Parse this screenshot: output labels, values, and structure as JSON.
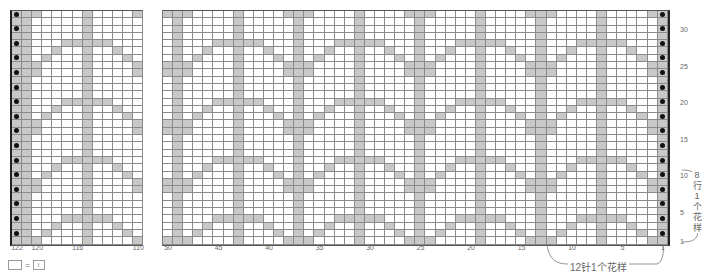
{
  "chart": {
    "rows": 32,
    "left_block": {
      "col_start": 122,
      "col_end": 110
    },
    "main_block": {
      "col_start": 50,
      "col_end": 1
    },
    "repeat": {
      "stitches": 12,
      "rows": 8
    },
    "shaded_by_repeat_row": {
      "1": [
        12,
        1,
        2,
        7
      ],
      "2": [
        11,
        3,
        1,
        7
      ],
      "3": [
        10,
        4,
        1,
        7
      ],
      "4": [
        9,
        8,
        7,
        6,
        5,
        1
      ],
      "5": [
        7,
        1
      ],
      "6": [
        7,
        1
      ],
      "7": [
        7,
        1
      ],
      "8": [
        12,
        1,
        2,
        7
      ]
    },
    "dot_columns": [
      122,
      1
    ],
    "dot_rows": "even",
    "colors": {
      "shaded": "#c8c8c8",
      "empty": "#ffffff",
      "gridline": "#8a8a8a",
      "dot": "#111111"
    }
  },
  "col_labels": [
    {
      "text": "122",
      "col": 122
    },
    {
      "text": "120",
      "col": 120
    },
    {
      "text": "116",
      "col": 116
    },
    {
      "text": "110",
      "col": 110
    },
    {
      "text": "50",
      "col": 50
    },
    {
      "text": "45",
      "col": 45
    },
    {
      "text": "40",
      "col": 40
    },
    {
      "text": "35",
      "col": 35
    },
    {
      "text": "30",
      "col": 30
    },
    {
      "text": "25",
      "col": 25
    },
    {
      "text": "20",
      "col": 20
    },
    {
      "text": "15",
      "col": 15
    },
    {
      "text": "10",
      "col": 10
    },
    {
      "text": "5",
      "col": 5
    },
    {
      "text": "1",
      "col": 1
    }
  ],
  "row_labels": [
    {
      "text": "30",
      "row": 30
    },
    {
      "text": "25",
      "row": 25
    },
    {
      "text": "20",
      "row": 20
    },
    {
      "text": "15",
      "row": 15
    },
    {
      "text": "10",
      "row": 10
    },
    {
      "text": "5",
      "row": 5
    },
    {
      "text": "1",
      "row": 1
    }
  ],
  "annotations": {
    "stitch_repeat": "12针1个花样",
    "row_repeat": "8行1个花样"
  },
  "legend": {
    "symbol_meaning": "I",
    "equals": "="
  }
}
